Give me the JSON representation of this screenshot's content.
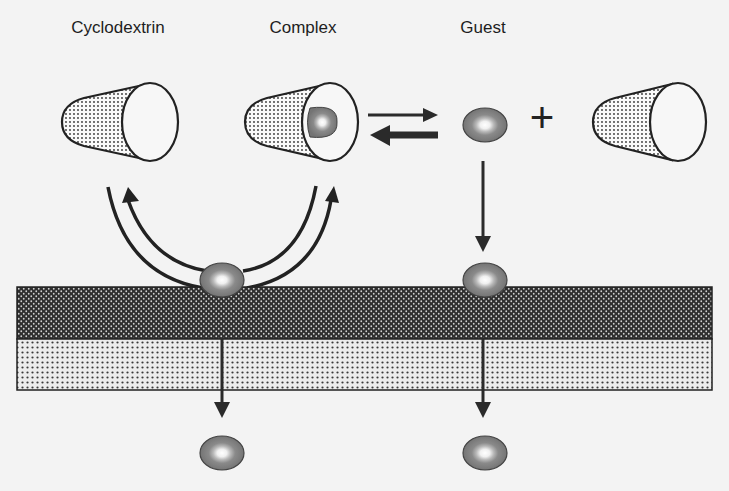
{
  "labels": {
    "cyclodextrin": "Cyclodextrin",
    "complex": "Complex",
    "guest": "Guest",
    "plus": "+"
  },
  "colors": {
    "background": "#f3f3f3",
    "outline": "#222222",
    "guest_outer": "#7a7a7a",
    "guest_mid": "#a8a8a8",
    "guest_core": "#f4f4f4",
    "membrane_top": "#3a3a3a",
    "membrane_bottom": "#d8d8d8"
  },
  "elements": {
    "cones": [
      "free-cyclodextrin",
      "complex",
      "released-cyclodextrin"
    ],
    "guests": [
      "guest-free",
      "guest-at-membrane-left",
      "guest-at-membrane-right",
      "guest-permeated-left",
      "guest-permeated-right"
    ],
    "membrane_layers": [
      "upper-layer",
      "lower-layer"
    ]
  }
}
